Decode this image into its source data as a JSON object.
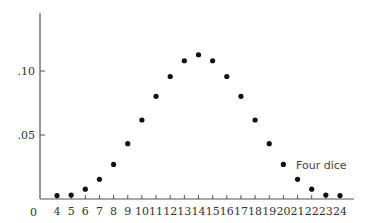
{
  "chart_data": {
    "type": "scatter",
    "title": "",
    "xlabel": "",
    "ylabel": "",
    "annotation": "Four dice",
    "origin_label": "0",
    "x": [
      4,
      5,
      6,
      7,
      8,
      9,
      10,
      11,
      12,
      13,
      14,
      15,
      16,
      17,
      18,
      19,
      20,
      21,
      22,
      23,
      24
    ],
    "values": [
      0.0008,
      0.0031,
      0.0077,
      0.0154,
      0.027,
      0.0432,
      0.0617,
      0.0802,
      0.0957,
      0.108,
      0.1127,
      0.108,
      0.0957,
      0.0802,
      0.0617,
      0.0432,
      0.027,
      0.0154,
      0.0077,
      0.0031,
      0.0008
    ],
    "y_ticks": [
      0.05,
      0.1
    ],
    "y_tick_labels": [
      ".05",
      ".10"
    ],
    "x_tick_labels": [
      "4",
      "5",
      "6",
      "7",
      "8",
      "9",
      "10",
      "11",
      "12",
      "13",
      "14",
      "15",
      "16",
      "17",
      "18",
      "19",
      "20",
      "21",
      "22",
      "23",
      "24"
    ],
    "ylim": [
      0,
      0.14
    ],
    "xlim": [
      3,
      25
    ],
    "grid": false,
    "legend": "none"
  }
}
